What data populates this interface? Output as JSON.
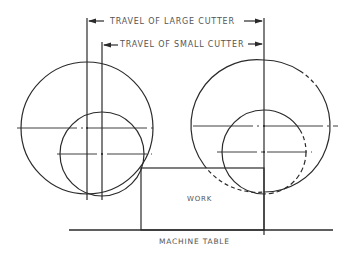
{
  "diagram": {
    "labels": {
      "travel_large": "TRAVEL OF LARGE CUTTER",
      "travel_small": "TRAVEL OF SMALL CUTTER",
      "work": "WORK",
      "machine_table": "MACHINE TABLE"
    },
    "colors": {
      "line": "#2a2a2a",
      "text": "#555555",
      "background": "#ffffff"
    }
  }
}
